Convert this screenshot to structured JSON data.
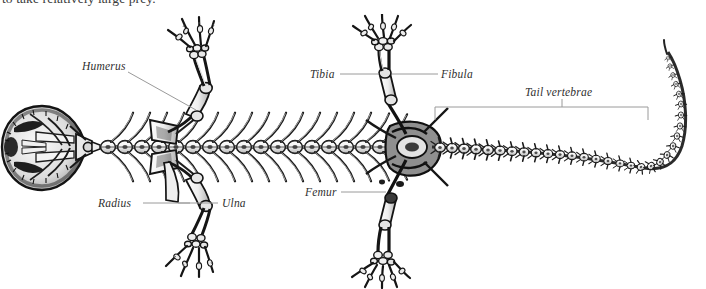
{
  "page": {
    "width": 706,
    "height": 289,
    "background": "#ffffff",
    "ink": "#1a1a1a",
    "text_color": "#2f2f2f",
    "leader_color": "#8a8a8a"
  },
  "body_text": {
    "clipped_line": "to take relatively large prey."
  },
  "figure": {
    "orientation": "skull at left, tail curving upward at right",
    "labels": [
      {
        "id": "humerus",
        "text": "Humerus",
        "style": "italic",
        "leader": "diagonal-down-right"
      },
      {
        "id": "tibia",
        "text": "Tibia",
        "style": "italic",
        "leader": "horizontal-right"
      },
      {
        "id": "fibula",
        "text": "Fibula",
        "style": "italic",
        "leader": "horizontal-left"
      },
      {
        "id": "tail-vertebrae",
        "text": "Tail vertebrae",
        "style": "italic",
        "leader": "span-bracket-below"
      },
      {
        "id": "radius",
        "text": "Radius",
        "style": "italic",
        "leader": "horizontal-right"
      },
      {
        "id": "ulna",
        "text": "Ulna",
        "style": "italic",
        "leader": "horizontal-left"
      },
      {
        "id": "femur",
        "text": "Femur",
        "style": "italic",
        "leader": "horizontal-right"
      }
    ],
    "parts": [
      {
        "id": "skull",
        "label": "broad flattened skull, dorsal view"
      },
      {
        "id": "trunk-vertebrae",
        "label": "trunk vertebral column with paired ribs"
      },
      {
        "id": "pectoral-girdle",
        "label": "pectoral girdle"
      },
      {
        "id": "pelvic-girdle",
        "label": "pelvic girdle"
      },
      {
        "id": "forelimb-upper",
        "label": "left forelimb with four digits"
      },
      {
        "id": "forelimb-lower",
        "label": "right forelimb with four digits"
      },
      {
        "id": "hindlimb-upper",
        "label": "left hindlimb with five digits"
      },
      {
        "id": "hindlimb-lower",
        "label": "right hindlimb with five digits"
      },
      {
        "id": "tail",
        "label": "tail vertebrae tapering and curving upward"
      }
    ]
  }
}
